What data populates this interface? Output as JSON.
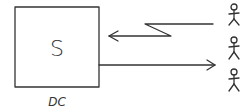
{
  "diagram": {
    "server_box": {
      "label": "S",
      "caption": "DC"
    },
    "arrows": [
      {
        "name": "wireless-request",
        "direction": "users-to-server",
        "style": "lightning"
      },
      {
        "name": "response",
        "direction": "server-to-users",
        "style": "straight"
      }
    ],
    "users": [
      {
        "icon": "stick-figure-icon"
      },
      {
        "icon": "stick-figure-icon"
      },
      {
        "icon": "stick-figure-icon"
      }
    ],
    "colors": {
      "stroke": "#333333",
      "background": "#ffffff"
    }
  }
}
